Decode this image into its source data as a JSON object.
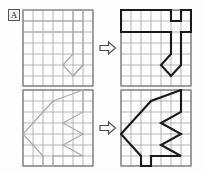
{
  "figure": {
    "label": "A",
    "label_box": {
      "border_color": "#555555",
      "fill": "#f2f2f2"
    },
    "background": "#fdfdfd",
    "width": 205,
    "height": 172
  },
  "grid": {
    "columns": 7,
    "rows": 7,
    "cell_px": 10,
    "line_color": "#9a9a9a",
    "border_color": "#6e6e6e"
  },
  "colors": {
    "faint_stroke": "#a8a8a8",
    "bold_stroke": "#1a1a1a",
    "arrow_stroke": "#4d4d4d",
    "arrow_fill": "#fbfbfb"
  },
  "arrows": [
    {
      "name": "transform-arrow-top",
      "direction": "right",
      "glyph": "arrow-right-icon"
    },
    {
      "name": "transform-arrow-bottom",
      "direction": "right",
      "glyph": "arrow-right-icon"
    }
  ],
  "panels": [
    {
      "id": "top-left",
      "role": "source",
      "style": "faint",
      "caption": "Top-left source grid with faint outline figure",
      "paths": [
        "M 1 1 L 48 1 L 48 9 L 59 9 L 59 1 L 71 1",
        "M 1 9 L 48 9",
        "M 1 19 L 59 19",
        "M 48 9 L 48 48 L 39 57 L 48 66 L 57 57 L 48 48",
        "M 59 9 L 59 57 L 48 66"
      ]
    },
    {
      "id": "top-right",
      "role": "result",
      "style": "bold",
      "caption": "Top-right grid with bold traced figure",
      "paths": [
        "M 2 2 L 49 2 L 49 11 L 60 11 L 60 2 L 70 2 L 70 20 L 60 20 L 60 57 L 49 67 L 38 57 L 49 47 L 49 20 L 2 20 L 2 2 Z"
      ]
    },
    {
      "id": "bottom-left",
      "role": "source",
      "style": "faint",
      "caption": "Bottom-left source grid with faint outline figure",
      "paths": [
        "M 58 2 L 22 20 L 10 30 L 1 48 L 10 66 L 22 66 L 22 76 L 36 76 L 36 66 L 58 66 L 45 55 L 58 47 L 45 38 L 58 29 L 58 2"
      ]
    },
    {
      "id": "bottom-right",
      "role": "result",
      "style": "bold",
      "caption": "Bottom-right grid with bold traced figure",
      "paths": [
        "M 59 3 L 23 20 L 10 31 L 2 48 L 10 66 L 23 66 L 23 76 L 37 76 L 37 66 L 59 66 L 46 55 L 59 47 L 46 38 L 59 29 L 59 3 Z"
      ]
    }
  ]
}
